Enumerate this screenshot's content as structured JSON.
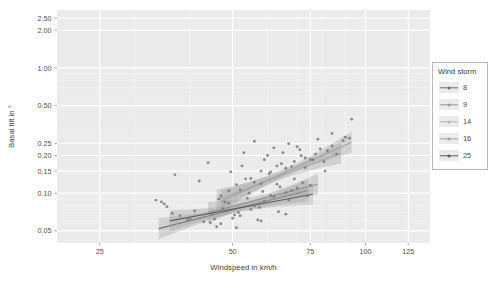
{
  "chart_data": {
    "type": "scatter",
    "title": "",
    "xlabel": "Windspeed in km/h",
    "ylabel": "Basal tilt in °",
    "xscale": "log",
    "yscale": "log",
    "xlim": [
      20,
      140
    ],
    "ylim": [
      0.04,
      2.9
    ],
    "xticks": [
      25,
      50,
      75,
      100,
      125
    ],
    "xticklabels": [
      "25",
      "50",
      "75",
      "100",
      "125"
    ],
    "yticks": [
      0.05,
      0.1,
      0.15,
      0.2,
      0.25,
      0.5,
      1.0,
      2.0,
      2.5
    ],
    "yticklabels": [
      "0.05",
      "0.10",
      "0.15",
      "0.20",
      "0.25",
      "0.50",
      "1.00",
      "2.00",
      "2.50"
    ],
    "grid": true,
    "legend": {
      "title": "Wind storm",
      "position": "right",
      "entries": [
        {
          "label": "8",
          "color": "#6e6e6e"
        },
        {
          "label": "9",
          "color": "#989898"
        },
        {
          "label": "14",
          "color": "#b4b4b4"
        },
        {
          "label": "16",
          "color": "#a2a2a2"
        },
        {
          "label": "25",
          "color": "#5a5a5a"
        }
      ]
    },
    "point_color": "#7a7a7a",
    "ribbon_color": "#9a9a9a",
    "series": [
      {
        "name": "8",
        "color": "#6e6e6e",
        "fit": {
          "x0": 34,
          "y0": 0.052,
          "x1": 74,
          "y1": 0.105
        },
        "points": [
          {
            "x": 33.5,
            "y": 0.088
          },
          {
            "x": 35.0,
            "y": 0.082
          },
          {
            "x": 36.5,
            "y": 0.069
          },
          {
            "x": 40.0,
            "y": 0.063
          },
          {
            "x": 42.0,
            "y": 0.125
          },
          {
            "x": 44.5,
            "y": 0.058
          },
          {
            "x": 47.0,
            "y": 0.057
          },
          {
            "x": 48.5,
            "y": 0.072
          },
          {
            "x": 50.0,
            "y": 0.063
          },
          {
            "x": 52.0,
            "y": 0.066
          },
          {
            "x": 55.0,
            "y": 0.074
          },
          {
            "x": 57.0,
            "y": 0.061
          },
          {
            "x": 59.0,
            "y": 0.086
          },
          {
            "x": 62.0,
            "y": 0.094
          },
          {
            "x": 66.0,
            "y": 0.101
          },
          {
            "x": 70.0,
            "y": 0.11
          }
        ]
      },
      {
        "name": "9",
        "color": "#989898",
        "fit": {
          "x0": 44,
          "y0": 0.07,
          "x1": 78,
          "y1": 0.118
        },
        "points": [
          {
            "x": 45.0,
            "y": 0.068
          },
          {
            "x": 47.5,
            "y": 0.075
          },
          {
            "x": 49.0,
            "y": 0.083
          },
          {
            "x": 51.5,
            "y": 0.07
          },
          {
            "x": 54.0,
            "y": 0.091
          },
          {
            "x": 56.0,
            "y": 0.079
          },
          {
            "x": 58.5,
            "y": 0.103
          },
          {
            "x": 61.0,
            "y": 0.096
          },
          {
            "x": 64.0,
            "y": 0.112
          },
          {
            "x": 68.0,
            "y": 0.105
          },
          {
            "x": 72.0,
            "y": 0.121
          },
          {
            "x": 75.0,
            "y": 0.116
          }
        ]
      },
      {
        "name": "14",
        "color": "#b4b4b4",
        "fit": {
          "x0": 46,
          "y0": 0.088,
          "x1": 88,
          "y1": 0.21
        },
        "points": [
          {
            "x": 46.5,
            "y": 0.09
          },
          {
            "x": 49.0,
            "y": 0.104
          },
          {
            "x": 51.0,
            "y": 0.117
          },
          {
            "x": 53.5,
            "y": 0.13
          },
          {
            "x": 56.0,
            "y": 0.122
          },
          {
            "x": 58.0,
            "y": 0.15
          },
          {
            "x": 60.5,
            "y": 0.143
          },
          {
            "x": 63.0,
            "y": 0.165
          },
          {
            "x": 66.0,
            "y": 0.158
          },
          {
            "x": 69.0,
            "y": 0.179
          },
          {
            "x": 73.0,
            "y": 0.191
          },
          {
            "x": 77.0,
            "y": 0.205
          },
          {
            "x": 82.0,
            "y": 0.218
          }
        ]
      },
      {
        "name": "16",
        "color": "#a2a2a2",
        "fit": {
          "x0": 47,
          "y0": 0.086,
          "x1": 93,
          "y1": 0.255
        },
        "points": [
          {
            "x": 48.0,
            "y": 0.085
          },
          {
            "x": 52.0,
            "y": 0.106
          },
          {
            "x": 55.0,
            "y": 0.131
          },
          {
            "x": 58.0,
            "y": 0.119
          },
          {
            "x": 61.0,
            "y": 0.148
          },
          {
            "x": 64.5,
            "y": 0.172
          },
          {
            "x": 68.0,
            "y": 0.163
          },
          {
            "x": 71.5,
            "y": 0.199
          },
          {
            "x": 75.0,
            "y": 0.186
          },
          {
            "x": 79.0,
            "y": 0.225
          },
          {
            "x": 84.0,
            "y": 0.238
          },
          {
            "x": 89.0,
            "y": 0.262
          },
          {
            "x": 92.0,
            "y": 0.275
          }
        ]
      },
      {
        "name": "25",
        "color": "#5a5a5a",
        "fit": {
          "x0": 36,
          "y0": 0.06,
          "x1": 76,
          "y1": 0.098
        },
        "points": [
          {
            "x": 37.0,
            "y": 0.14
          },
          {
            "x": 39.5,
            "y": 0.061
          },
          {
            "x": 43.0,
            "y": 0.059
          },
          {
            "x": 46.0,
            "y": 0.054
          },
          {
            "x": 50.5,
            "y": 0.067
          },
          {
            "x": 53.0,
            "y": 0.21
          },
          {
            "x": 57.5,
            "y": 0.077
          },
          {
            "x": 60.0,
            "y": 0.2
          },
          {
            "x": 63.5,
            "y": 0.071
          },
          {
            "x": 67.0,
            "y": 0.088
          },
          {
            "x": 70.0,
            "y": 0.235
          },
          {
            "x": 74.0,
            "y": 0.095
          }
        ]
      }
    ],
    "extra_points": [
      {
        "x": 56.0,
        "y": 0.26
      },
      {
        "x": 62.0,
        "y": 0.23
      },
      {
        "x": 67.0,
        "y": 0.248
      },
      {
        "x": 73.0,
        "y": 0.16
      },
      {
        "x": 78.0,
        "y": 0.27
      },
      {
        "x": 80.5,
        "y": 0.179
      },
      {
        "x": 84.0,
        "y": 0.3
      },
      {
        "x": 86.0,
        "y": 0.205
      },
      {
        "x": 90.0,
        "y": 0.28
      },
      {
        "x": 93.0,
        "y": 0.39
      },
      {
        "x": 44.0,
        "y": 0.175
      },
      {
        "x": 41.0,
        "y": 0.072
      },
      {
        "x": 52.5,
        "y": 0.165
      },
      {
        "x": 49.5,
        "y": 0.148
      },
      {
        "x": 65.0,
        "y": 0.21
      },
      {
        "x": 59.0,
        "y": 0.185
      },
      {
        "x": 71.0,
        "y": 0.222
      },
      {
        "x": 76.0,
        "y": 0.185
      },
      {
        "x": 54.5,
        "y": 0.1
      },
      {
        "x": 47.0,
        "y": 0.095
      },
      {
        "x": 69.0,
        "y": 0.13
      },
      {
        "x": 63.0,
        "y": 0.118
      },
      {
        "x": 81.0,
        "y": 0.15
      },
      {
        "x": 58.0,
        "y": 0.06
      },
      {
        "x": 51.0,
        "y": 0.053
      },
      {
        "x": 66.0,
        "y": 0.068
      },
      {
        "x": 34.5,
        "y": 0.085
      },
      {
        "x": 35.5,
        "y": 0.078
      },
      {
        "x": 38.0,
        "y": 0.066
      },
      {
        "x": 45.5,
        "y": 0.062
      }
    ]
  }
}
